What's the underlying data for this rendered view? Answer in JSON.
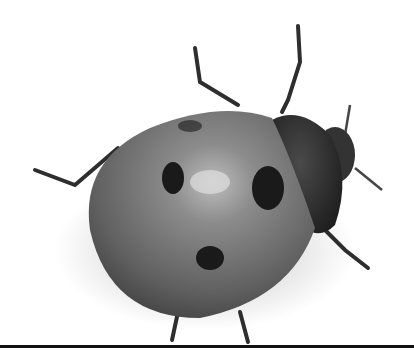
{
  "image": {
    "subject": "ladybug (seven-spot ladybird) photographed from above, grayscale",
    "background": "#ffffff",
    "colors": {
      "shell_light": "#9a9a9a",
      "shell_mid": "#6e6e6e",
      "shell_dark": "#3a3a3a",
      "spot": "#1a1a1a",
      "pronotum": "#2a2a2a",
      "legs": "#2e2e2e",
      "baseline": "#111111"
    }
  }
}
